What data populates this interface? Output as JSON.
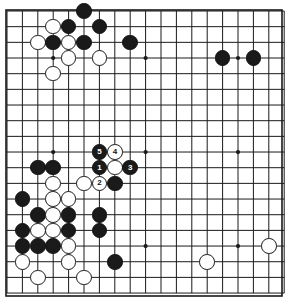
{
  "diagram": {
    "kind": "go-board-diagram",
    "board_size": 19,
    "colors": {
      "background": "#ffffff",
      "grid_line": "#1a1a1a",
      "board_border": "#1a1a1a",
      "black_stone": "#1a1a1a",
      "white_stone": "#ffffff",
      "white_stone_outline": "#1a1a1a",
      "black_label_text": "#ffffff",
      "white_label_text": "#111111"
    },
    "geometry": {
      "origin_x": 7,
      "origin_y": 11,
      "step_x": 15.4,
      "step_y": 15.67,
      "stone_diameter": 15.6,
      "border_left": 6,
      "border_top": 10,
      "border_width": 276,
      "border_height": 286
    },
    "star_points": [
      {
        "col": 3,
        "row": 3
      },
      {
        "col": 9,
        "row": 3
      },
      {
        "col": 15,
        "row": 3
      },
      {
        "col": 3,
        "row": 9
      },
      {
        "col": 9,
        "row": 9
      },
      {
        "col": 15,
        "row": 9
      },
      {
        "col": 3,
        "row": 15
      },
      {
        "col": 9,
        "row": 15
      },
      {
        "col": 15,
        "row": 15
      }
    ],
    "move_numbers": [
      "1",
      "2",
      "3",
      "4",
      "5"
    ],
    "stones": [
      {
        "col": 5,
        "row": 0,
        "color": "black",
        "label": ""
      },
      {
        "col": 3,
        "row": 1,
        "color": "white",
        "label": ""
      },
      {
        "col": 4,
        "row": 1,
        "color": "black",
        "label": ""
      },
      {
        "col": 6,
        "row": 1,
        "color": "black",
        "label": ""
      },
      {
        "col": 2,
        "row": 2,
        "color": "white",
        "label": ""
      },
      {
        "col": 3,
        "row": 2,
        "color": "black",
        "label": ""
      },
      {
        "col": 4,
        "row": 2,
        "color": "white",
        "label": ""
      },
      {
        "col": 5,
        "row": 2,
        "color": "black",
        "label": ""
      },
      {
        "col": 8,
        "row": 2,
        "color": "black",
        "label": ""
      },
      {
        "col": 4,
        "row": 3,
        "color": "white",
        "label": ""
      },
      {
        "col": 6,
        "row": 3,
        "color": "white",
        "label": ""
      },
      {
        "col": 14,
        "row": 3,
        "color": "black",
        "label": ""
      },
      {
        "col": 16,
        "row": 3,
        "color": "black",
        "label": ""
      },
      {
        "col": 3,
        "row": 4,
        "color": "white",
        "label": ""
      },
      {
        "col": 6,
        "row": 9,
        "color": "black",
        "label": "5"
      },
      {
        "col": 7,
        "row": 9,
        "color": "white",
        "label": "4"
      },
      {
        "col": 2,
        "row": 10,
        "color": "black",
        "label": ""
      },
      {
        "col": 3,
        "row": 10,
        "color": "black",
        "label": ""
      },
      {
        "col": 6,
        "row": 10,
        "color": "black",
        "label": "1"
      },
      {
        "col": 7,
        "row": 10,
        "color": "white",
        "label": ""
      },
      {
        "col": 8,
        "row": 10,
        "color": "black",
        "label": "3"
      },
      {
        "col": 3,
        "row": 11,
        "color": "white",
        "label": ""
      },
      {
        "col": 5,
        "row": 11,
        "color": "white",
        "label": ""
      },
      {
        "col": 6,
        "row": 11,
        "color": "white",
        "label": "2"
      },
      {
        "col": 7,
        "row": 11,
        "color": "black",
        "label": ""
      },
      {
        "col": 1,
        "row": 12,
        "color": "black",
        "label": ""
      },
      {
        "col": 3,
        "row": 12,
        "color": "white",
        "label": ""
      },
      {
        "col": 4,
        "row": 12,
        "color": "white",
        "label": ""
      },
      {
        "col": 2,
        "row": 13,
        "color": "black",
        "label": ""
      },
      {
        "col": 3,
        "row": 13,
        "color": "white",
        "label": ""
      },
      {
        "col": 4,
        "row": 13,
        "color": "black",
        "label": ""
      },
      {
        "col": 6,
        "row": 13,
        "color": "black",
        "label": ""
      },
      {
        "col": 1,
        "row": 14,
        "color": "black",
        "label": ""
      },
      {
        "col": 2,
        "row": 14,
        "color": "white",
        "label": ""
      },
      {
        "col": 3,
        "row": 14,
        "color": "white",
        "label": ""
      },
      {
        "col": 4,
        "row": 14,
        "color": "black",
        "label": ""
      },
      {
        "col": 6,
        "row": 14,
        "color": "black",
        "label": ""
      },
      {
        "col": 1,
        "row": 15,
        "color": "black",
        "label": ""
      },
      {
        "col": 2,
        "row": 15,
        "color": "black",
        "label": ""
      },
      {
        "col": 3,
        "row": 15,
        "color": "black",
        "label": ""
      },
      {
        "col": 4,
        "row": 15,
        "color": "white",
        "label": ""
      },
      {
        "col": 17,
        "row": 15,
        "color": "white",
        "label": ""
      },
      {
        "col": 1,
        "row": 16,
        "color": "white",
        "label": ""
      },
      {
        "col": 4,
        "row": 16,
        "color": "white",
        "label": ""
      },
      {
        "col": 7,
        "row": 16,
        "color": "black",
        "label": ""
      },
      {
        "col": 13,
        "row": 16,
        "color": "white",
        "label": ""
      },
      {
        "col": 2,
        "row": 17,
        "color": "white",
        "label": ""
      },
      {
        "col": 5,
        "row": 17,
        "color": "white",
        "label": ""
      }
    ]
  }
}
